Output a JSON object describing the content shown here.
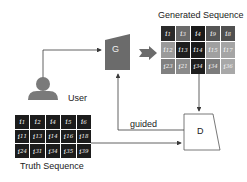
{
  "labels": {
    "generated_title": "Generated Sequence",
    "truth_title": "Truth Sequence",
    "user": "User",
    "generator": "G",
    "discriminator": "D",
    "guided": "guided"
  },
  "generated_sequence": {
    "rows": [
      [
        {
          "base": "i",
          "sub": "1",
          "shade": "#2a2a2a"
        },
        {
          "base": "i",
          "sub": "3",
          "shade": "#6a6a6a"
        },
        {
          "base": "i",
          "sub": "4",
          "shade": "#1a1a1a"
        },
        {
          "base": "i",
          "sub": "9",
          "shade": "#555555"
        },
        {
          "base": "i",
          "sub": "8",
          "shade": "#505050"
        }
      ],
      [
        {
          "base": "i",
          "sub": "12",
          "shade": "#9a9a9a"
        },
        {
          "base": "i",
          "sub": "13",
          "shade": "#1e1e1e"
        },
        {
          "base": "i",
          "sub": "14",
          "shade": "#1a1a1a"
        },
        {
          "base": "i",
          "sub": "15",
          "shade": "#a0a0a0"
        },
        {
          "base": "i",
          "sub": "17",
          "shade": "#a5a5a5"
        }
      ],
      [
        {
          "base": "i",
          "sub": "23",
          "shade": "#808080"
        },
        {
          "base": "i",
          "sub": "21",
          "shade": "#8a8a8a"
        },
        {
          "base": "i",
          "sub": "34",
          "shade": "#1e1e1e"
        },
        {
          "base": "i",
          "sub": "34",
          "shade": "#7c7c7c"
        },
        {
          "base": "i",
          "sub": "36",
          "shade": "#a8a8a8"
        }
      ]
    ]
  },
  "truth_sequence": {
    "rows": [
      [
        {
          "base": "i",
          "sub": "1"
        },
        {
          "base": "i",
          "sub": "2"
        },
        {
          "base": "i",
          "sub": "4"
        },
        {
          "base": "i",
          "sub": "5"
        },
        {
          "base": "i",
          "sub": "6"
        }
      ],
      [
        {
          "base": "i",
          "sub": "11"
        },
        {
          "base": "i",
          "sub": "13"
        },
        {
          "base": "i",
          "sub": "14"
        },
        {
          "base": "i",
          "sub": "16"
        },
        {
          "base": "i",
          "sub": "18"
        }
      ],
      [
        {
          "base": "i",
          "sub": "24"
        },
        {
          "base": "i",
          "sub": "31"
        },
        {
          "base": "i",
          "sub": "34"
        },
        {
          "base": "i",
          "sub": "35"
        },
        {
          "base": "i",
          "sub": "39"
        }
      ]
    ],
    "shade": "#1c1c1c"
  },
  "colors": {
    "generator_fill": "#6b6b6b",
    "user_fill": "#7a7a7a",
    "arrow_fill": "#6b6b6b",
    "line": "#3a3a3a"
  }
}
